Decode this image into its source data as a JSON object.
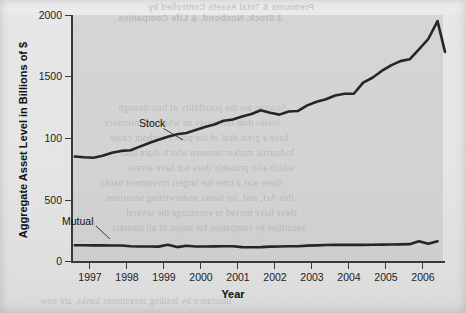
{
  "chart_data": {
    "type": "line",
    "title": "",
    "xlabel": "Year",
    "ylabel": "Aggregate Asset Level in Billions of $",
    "xlim": [
      1996.6,
      2006.65
    ],
    "ylim": [
      0,
      2000
    ],
    "grid": false,
    "legend_position": "inline-annotation",
    "y_ticks": [
      0,
      500,
      100,
      1500,
      2000
    ],
    "y_tick_labels": [
      "0",
      "500",
      "100",
      "1500",
      "2000"
    ],
    "x_ticks": [
      1997,
      1998,
      1999,
      2000,
      2001,
      2002,
      2003,
      2004,
      2005,
      2006
    ],
    "x_tick_labels": [
      "1997",
      "1998",
      "1999",
      "2000",
      "2001",
      "2002",
      "2003",
      "2004",
      "2005",
      "2006"
    ],
    "annotations": [
      {
        "text": "Stock",
        "x": 1999.1,
        "y": 1180
      },
      {
        "text": "Mutual",
        "x": 1997.25,
        "y": 330
      }
    ],
    "series": [
      {
        "name": "Stock",
        "x": [
          1996.7,
          1996.95,
          1997.2,
          1997.45,
          1997.7,
          1997.95,
          1998.2,
          1998.45,
          1998.7,
          1998.95,
          1999.2,
          1999.45,
          1999.7,
          1999.95,
          2000.2,
          2000.45,
          2000.7,
          2000.95,
          2001.2,
          2001.45,
          2001.7,
          2001.95,
          2002.2,
          2002.45,
          2002.7,
          2002.95,
          2003.2,
          2003.45,
          2003.7,
          2003.95,
          2004.2,
          2004.45,
          2004.7,
          2004.95,
          2005.2,
          2005.45,
          2005.7,
          2005.95,
          2006.2,
          2006.45
        ],
        "y": [
          850,
          843,
          840,
          855,
          880,
          895,
          900,
          930,
          960,
          985,
          1010,
          1030,
          1040,
          1065,
          1090,
          1110,
          1140,
          1150,
          1175,
          1195,
          1225,
          1205,
          1190,
          1215,
          1220,
          1265,
          1295,
          1315,
          1345,
          1360,
          1360,
          1450,
          1490,
          1545,
          1590,
          1625,
          1640,
          1720,
          1805,
          1950
        ],
        "y_end_drop": 1700
      },
      {
        "name": "Mutual",
        "x": [
          1996.7,
          1996.95,
          1997.2,
          1997.45,
          1997.7,
          1997.95,
          1998.2,
          1998.45,
          1998.7,
          1998.95,
          1999.2,
          1999.45,
          1999.7,
          1999.95,
          2000.2,
          2000.45,
          2000.7,
          2000.95,
          2001.2,
          2001.45,
          2001.7,
          2001.95,
          2002.2,
          2002.45,
          2002.7,
          2002.95,
          2003.2,
          2003.45,
          2003.7,
          2003.95,
          2004.2,
          2004.45,
          2004.7,
          2004.95,
          2005.2,
          2005.45,
          2005.7,
          2005.95,
          2006.2,
          2006.45
        ],
        "y": [
          128,
          128,
          127,
          127,
          126,
          126,
          120,
          118,
          118,
          117,
          132,
          113,
          124,
          118,
          118,
          119,
          120,
          120,
          113,
          112,
          113,
          117,
          118,
          120,
          120,
          125,
          127,
          130,
          131,
          131,
          131,
          131,
          132,
          133,
          134,
          135,
          137,
          160,
          140,
          160
        ]
      }
    ]
  },
  "axes": {
    "y_title": "Aggregate Asset Level in Billions of $",
    "x_title": "Year"
  },
  "series_labels": {
    "stock": "Stock",
    "mutual": "Mutual"
  },
  "colors": {
    "line": "#262626",
    "axis": "#3a3a3a",
    "panel": "#bdbdbd",
    "paper": "#e8e8e8",
    "text": "#1d1d1d"
  },
  "background_bleed": {
    "lines": [
      "Premiums & Total Assets Controlled by",
      "3 Stock, Nonbond, & Life Companies",
      "Sources are the possibility of loss through",
      "losses than the losses on which of insurance",
      "have a great deal of the policy without cause",
      "Industrial market between which share than",
      "which also probably does not have access",
      "there was a time the largest investment banks",
      "this Act, and, for banks underwriting securities",
      "these have moved to encourage the several",
      "securities by companies for major of all insurers",
      "insurance by leading investment banks, are now"
    ]
  }
}
